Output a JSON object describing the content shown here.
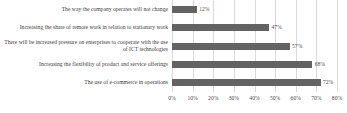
{
  "chart_data": {
    "type": "bar",
    "orientation": "horizontal",
    "title": "",
    "subtitle": "",
    "xlabel": "",
    "ylabel": "",
    "xlim": [
      0,
      80
    ],
    "grid": true,
    "legend": false,
    "legend_position": "none",
    "bar_color": "#636363",
    "gridline_color": "#d9d9d9",
    "text_color": "#3b3b3b",
    "value_suffix": "%",
    "categories": [
      "The way the company operates will not change",
      "Increasing the share of remote work in relation to stationary work",
      "There will be increased pressure on enterprises to cooperate with the use of ICT technologies",
      "Increasing the flexibility of product and service offerings",
      "The use of e-commerce in operations"
    ],
    "values": [
      12,
      47,
      57,
      68,
      72
    ],
    "data_labels": [
      "12%",
      "47%",
      "57%",
      "68%",
      "72%"
    ],
    "xticks": [
      0,
      10,
      20,
      30,
      40,
      50,
      60,
      70,
      80
    ],
    "xtick_labels": [
      "0%",
      "10%",
      "20%",
      "30%",
      "40%",
      "50%",
      "60%",
      "70%",
      "80%"
    ]
  }
}
